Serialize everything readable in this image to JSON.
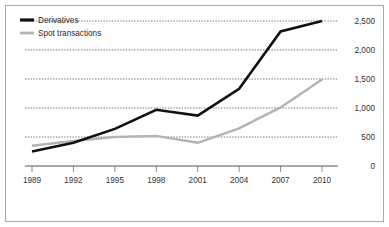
{
  "chart_data": {
    "type": "line",
    "title": "",
    "subtitle": "",
    "xlabel": "",
    "ylabel": "",
    "x": [
      1989,
      1992,
      1995,
      1998,
      2001,
      2004,
      2007,
      2010
    ],
    "xticklabels": [
      "1989",
      "1992",
      "1995",
      "1998",
      "2001",
      "2004",
      "2007",
      "2010"
    ],
    "yticks": [
      0,
      500,
      1000,
      1500,
      2000,
      2500
    ],
    "yticklabels": [
      "0",
      "500",
      "1,000",
      "1,500",
      "2,000",
      "2,500"
    ],
    "ylim": [
      0,
      2600
    ],
    "xlim": [
      1989,
      2010
    ],
    "grid": "horizontal-dotted",
    "y_axis_side": "right",
    "legend_position": "top-left",
    "series": [
      {
        "name": "Derivatives",
        "color": "#101010",
        "values": [
          250,
          400,
          640,
          970,
          870,
          1330,
          2320,
          2500
        ]
      },
      {
        "name": "Spot transactions",
        "color": "#b3b3b3",
        "values": [
          350,
          430,
          500,
          520,
          400,
          650,
          1010,
          1490
        ]
      }
    ]
  },
  "legend": {
    "items": [
      {
        "label": "Derivatives"
      },
      {
        "label": "Spot transactions"
      }
    ]
  },
  "colors": {
    "derivatives": "#101010",
    "spot": "#b3b3b3",
    "grid": "#3a3a3a",
    "axis": "#555555",
    "frame": "#a8a8a8",
    "background": "#ffffff"
  }
}
